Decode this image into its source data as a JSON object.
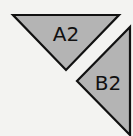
{
  "diagram": {
    "background": "#f3f3f1",
    "shapes": [
      {
        "id": "A2",
        "label": "A2",
        "kind": "triangle-down",
        "points": "13,15 119,15 66,70",
        "label_x": 66,
        "label_y": 41,
        "fill": "#b4b4b4",
        "stroke": "#111111"
      },
      {
        "id": "B2",
        "label": "B2",
        "kind": "triangle-left",
        "points": "130,27 130,135 77,81",
        "label_x": 108,
        "label_y": 90,
        "fill": "#b4b4b4",
        "stroke": "#111111"
      }
    ]
  }
}
